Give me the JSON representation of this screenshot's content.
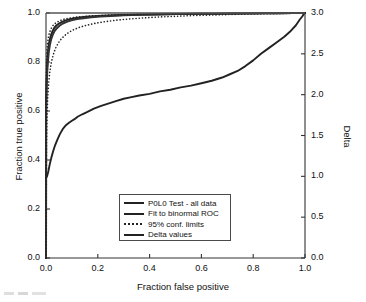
{
  "chart_data": {
    "type": "line",
    "title": "",
    "xlabel": "Fraction false positive",
    "ylabel": "Fraction true positive",
    "y2label": "Delta",
    "xlim": [
      0.0,
      1.0
    ],
    "ylim": [
      0.0,
      1.0
    ],
    "y2lim": [
      0.0,
      3.0
    ],
    "grid": false,
    "legend_position": "lower center",
    "xticks": [
      "0.0",
      "0.2",
      "0.4",
      "0.6",
      "0.8",
      "1.0"
    ],
    "xtick_values": [
      0.0,
      0.2,
      0.4,
      0.6,
      0.8,
      1.0
    ],
    "yticks": [
      "0.0",
      "0.2",
      "0.4",
      "0.6",
      "0.8",
      "1.0"
    ],
    "ytick_values": [
      0.0,
      0.2,
      0.4,
      0.6,
      0.8,
      1.0
    ],
    "y2ticks": [
      "0.0",
      "0.5",
      "1.0",
      "1.5",
      "2.0",
      "2.5",
      "3.0"
    ],
    "y2tick_values": [
      0.0,
      0.5,
      1.0,
      1.5,
      2.0,
      2.5,
      3.0
    ],
    "series": [
      {
        "name": "P0L0 Test - all data",
        "style": "solid",
        "axis": "left",
        "color": "#222222",
        "x": [
          0.0,
          0.0,
          0.002,
          0.004,
          0.006,
          0.009,
          0.012,
          0.016,
          0.02,
          0.026,
          0.032,
          0.04,
          0.05,
          0.062,
          0.076,
          0.092,
          0.11,
          0.13,
          0.155,
          0.185,
          0.22,
          0.26,
          0.3,
          0.35,
          0.4,
          0.45,
          0.5,
          0.55,
          0.6,
          0.65,
          0.7,
          0.75,
          0.8,
          0.85,
          0.9,
          0.95,
          1.0
        ],
        "y": [
          0.0,
          0.62,
          0.72,
          0.78,
          0.82,
          0.855,
          0.878,
          0.897,
          0.912,
          0.928,
          0.939,
          0.949,
          0.957,
          0.964,
          0.97,
          0.975,
          0.979,
          0.982,
          0.985,
          0.987,
          0.989,
          0.991,
          0.992,
          0.993,
          0.994,
          0.995,
          0.9955,
          0.996,
          0.9965,
          0.997,
          0.9975,
          0.998,
          0.998,
          0.999,
          0.999,
          0.9995,
          1.0
        ]
      },
      {
        "name": "Fit to binormal ROC",
        "style": "solid",
        "axis": "left",
        "color": "#333333",
        "x": [
          0.0,
          0.001,
          0.003,
          0.005,
          0.008,
          0.011,
          0.015,
          0.02,
          0.026,
          0.033,
          0.042,
          0.052,
          0.065,
          0.08,
          0.098,
          0.12,
          0.145,
          0.175,
          0.21,
          0.25,
          0.3,
          0.36,
          0.43,
          0.5,
          0.58,
          0.66,
          0.74,
          0.82,
          0.9,
          0.95,
          1.0
        ],
        "y": [
          0.0,
          0.6,
          0.705,
          0.765,
          0.81,
          0.843,
          0.87,
          0.893,
          0.911,
          0.926,
          0.938,
          0.948,
          0.957,
          0.964,
          0.97,
          0.975,
          0.979,
          0.983,
          0.986,
          0.988,
          0.991,
          0.993,
          0.994,
          0.9955,
          0.9965,
          0.997,
          0.998,
          0.9985,
          0.999,
          0.9995,
          1.0
        ]
      },
      {
        "name": "95% conf. limits",
        "style": "dotted",
        "axis": "left",
        "color": "#222222",
        "bound": "upper",
        "x": [
          0.0,
          0.001,
          0.002,
          0.004,
          0.006,
          0.009,
          0.013,
          0.018,
          0.024,
          0.031,
          0.04,
          0.05,
          0.063,
          0.078,
          0.096,
          0.118,
          0.143,
          0.173,
          0.21,
          0.25,
          0.3,
          0.36,
          0.43,
          0.5,
          0.58,
          0.66,
          0.74,
          0.82,
          0.9,
          0.95,
          1.0
        ],
        "y": [
          0.0,
          0.72,
          0.8,
          0.848,
          0.878,
          0.9,
          0.918,
          0.933,
          0.945,
          0.954,
          0.961,
          0.967,
          0.973,
          0.977,
          0.98,
          0.983,
          0.986,
          0.988,
          0.99,
          0.992,
          0.993,
          0.9945,
          0.996,
          0.997,
          0.9975,
          0.998,
          0.9985,
          0.999,
          0.9995,
          0.9995,
          1.0
        ]
      },
      {
        "name": "95% conf. limits",
        "style": "dotted",
        "axis": "left",
        "color": "#222222",
        "bound": "lower",
        "x": [
          0.0,
          0.002,
          0.004,
          0.007,
          0.011,
          0.015,
          0.021,
          0.028,
          0.036,
          0.046,
          0.058,
          0.072,
          0.088,
          0.107,
          0.13,
          0.157,
          0.19,
          0.23,
          0.275,
          0.325,
          0.38,
          0.44,
          0.51,
          0.58,
          0.65,
          0.72,
          0.79,
          0.86,
          0.92,
          0.96,
          1.0
        ],
        "y": [
          0.0,
          0.46,
          0.58,
          0.662,
          0.722,
          0.763,
          0.8,
          0.83,
          0.854,
          0.875,
          0.893,
          0.908,
          0.921,
          0.932,
          0.942,
          0.95,
          0.958,
          0.965,
          0.971,
          0.976,
          0.98,
          0.984,
          0.987,
          0.99,
          0.992,
          0.994,
          0.996,
          0.997,
          0.998,
          0.999,
          1.0
        ]
      },
      {
        "name": "Delta values",
        "style": "solid",
        "axis": "right",
        "color": "#222222",
        "x": [
          0.0,
          0.004,
          0.009,
          0.014,
          0.02,
          0.027,
          0.035,
          0.044,
          0.054,
          0.065,
          0.078,
          0.09,
          0.1,
          0.11,
          0.122,
          0.14,
          0.16,
          0.185,
          0.21,
          0.24,
          0.27,
          0.3,
          0.33,
          0.36,
          0.4,
          0.44,
          0.48,
          0.52,
          0.56,
          0.6,
          0.64,
          0.68,
          0.71,
          0.74,
          0.77,
          0.8,
          0.83,
          0.86,
          0.89,
          0.92,
          0.945,
          0.965,
          0.98,
          0.99,
          0.996,
          1.0
        ],
        "y_delta": [
          0.98,
          1.0,
          1.06,
          1.14,
          1.22,
          1.3,
          1.38,
          1.45,
          1.52,
          1.58,
          1.63,
          1.66,
          1.68,
          1.7,
          1.73,
          1.76,
          1.79,
          1.83,
          1.86,
          1.89,
          1.92,
          1.95,
          1.97,
          1.99,
          2.01,
          2.04,
          2.06,
          2.09,
          2.11,
          2.14,
          2.17,
          2.21,
          2.25,
          2.29,
          2.35,
          2.42,
          2.5,
          2.57,
          2.64,
          2.71,
          2.78,
          2.85,
          2.92,
          2.96,
          2.99,
          3.0
        ]
      }
    ],
    "legend_entries": [
      {
        "label": "P0L0 Test - all data",
        "style": "solid"
      },
      {
        "label": "Fit to binormal ROC",
        "style": "solid"
      },
      {
        "label": "95% conf. limits",
        "style": "dotted"
      },
      {
        "label": "Delta values",
        "style": "solid"
      }
    ]
  }
}
